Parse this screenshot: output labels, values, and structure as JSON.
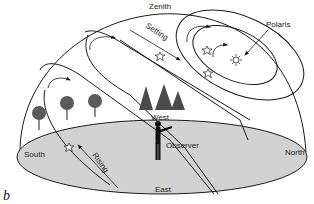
{
  "figure": {
    "panel_label": "b",
    "labels": {
      "zenith": "Zenith",
      "setting": "Setting",
      "rising": "Rising",
      "polaris": "Polaris",
      "west": "West",
      "east": "East",
      "south": "South",
      "north": "North",
      "observer": "Observer"
    },
    "colors": {
      "ground": "#d2d2d2",
      "line": "#1a1a1a",
      "tree": "#5a5a5a",
      "background": "#ffffff"
    },
    "elements": {
      "dome": "celestial-hemisphere",
      "horizon": "horizon-plane-ellipse",
      "star_paths": [
        "outer-circumpolar-arc",
        "inner-circumpolar-arc",
        "polaris-loop-outer",
        "polaris-loop-inner",
        "rising-setting-band-left",
        "rising-setting-band-right"
      ],
      "stars": [
        "star-setting",
        "star-circumpolar-1",
        "star-circumpolar-2",
        "star-rising",
        "polaris"
      ],
      "trees_deciduous": 3,
      "trees_conifer": 3
    }
  }
}
